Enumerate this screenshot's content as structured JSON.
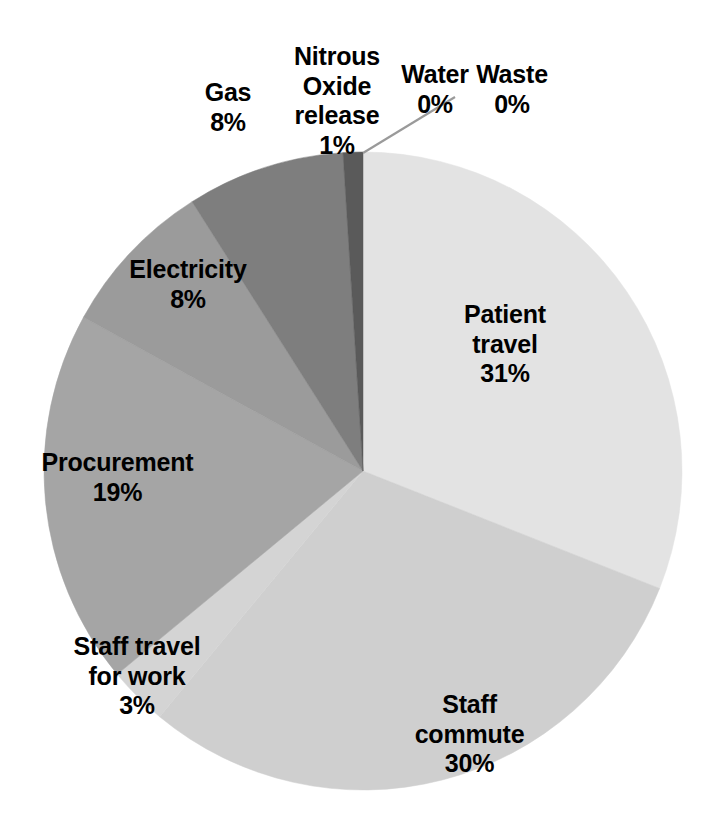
{
  "chart_data": {
    "type": "pie",
    "title": "",
    "subtitle": "",
    "xlabel": "",
    "ylabel": "",
    "legend_position": "none",
    "grid": false,
    "labels_on_slices": true,
    "start_angle_deg": 0,
    "direction": "clockwise",
    "categories": [
      "Patient travel",
      "Water",
      "Waste",
      "Staff commute",
      "Staff travel for work",
      "Procurement",
      "Electricity",
      "Gas",
      "Nitrous Oxide release"
    ],
    "values": [
      31,
      0,
      0,
      30,
      3,
      19,
      8,
      8,
      1
    ],
    "value_unit": "%",
    "slices": [
      {
        "name": "Patient travel",
        "value": 31,
        "percent_text": "31%",
        "label_text": "Patient\ntravel\n31%",
        "color": "#e3e3e3"
      },
      {
        "name": "Water",
        "value": 0,
        "percent_text": "0%",
        "label_text": "Water\n0%",
        "color": "#dedede"
      },
      {
        "name": "Waste",
        "value": 0,
        "percent_text": "0%",
        "label_text": "Waste\n0%",
        "color": "#dedede"
      },
      {
        "name": "Staff commute",
        "value": 30,
        "percent_text": "30%",
        "label_text": "Staff\ncommute\n30%",
        "color": "#cfcfcf"
      },
      {
        "name": "Staff travel for work",
        "value": 3,
        "percent_text": "3%",
        "label_text": "Staff travel\nfor work\n3%",
        "color": "#d4d4d4"
      },
      {
        "name": "Procurement",
        "value": 19,
        "percent_text": "19%",
        "label_text": "Procurement\n19%",
        "color": "#a5a5a5"
      },
      {
        "name": "Electricity",
        "value": 8,
        "percent_text": "8%",
        "label_text": "Electricity\n8%",
        "color": "#9b9b9b"
      },
      {
        "name": "Gas",
        "value": 8,
        "percent_text": "8%",
        "label_text": "Gas\n8%",
        "color": "#7e7e7e"
      },
      {
        "name": "Nitrous Oxide release",
        "value": 1,
        "percent_text": "1%",
        "label_text": "Nitrous\nOxide\nrelease\n1%",
        "color": "#5a5a5a"
      }
    ]
  },
  "colors": {
    "background": "#ffffff",
    "text": "#000000",
    "leader_line": "#9a9a9a"
  }
}
